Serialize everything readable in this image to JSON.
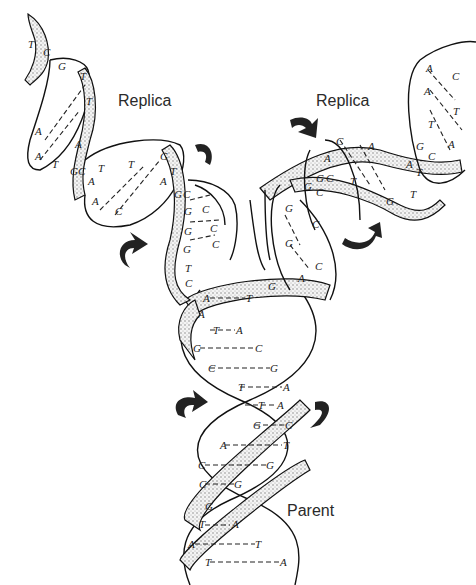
{
  "figure": {
    "labels": {
      "replica_left": "Replica",
      "replica_right": "Replica",
      "parent": "Parent"
    },
    "parent_pairs": [
      [
        "A",
        "T"
      ],
      [
        "A",
        ""
      ],
      [
        "T",
        "A"
      ],
      [
        "G",
        "C"
      ],
      [
        "C",
        "G"
      ],
      [
        "T",
        "A"
      ],
      [
        "T",
        "A"
      ],
      [
        "G",
        "C"
      ],
      [
        "A",
        "T"
      ],
      [
        "C",
        "G"
      ],
      [
        "C",
        "G"
      ],
      [
        "G",
        ""
      ],
      [
        "T",
        "A"
      ],
      [
        "A",
        "T"
      ],
      [
        "T",
        "A"
      ]
    ],
    "left_replica_bases": [
      "T",
      "C",
      "G",
      "T",
      "T",
      "A",
      "A",
      "T",
      "A",
      "G",
      "C",
      "A",
      "T",
      "T",
      "C",
      "A",
      "G",
      "C",
      "C",
      "G",
      "C",
      "G",
      "C",
      "G",
      "C",
      "T",
      "C"
    ],
    "right_replica_bases": [
      "A",
      "C",
      "A",
      "T",
      "T",
      "A",
      "C",
      "G",
      "A",
      "C",
      "A",
      "T",
      "G",
      "C",
      "C",
      "G",
      "T",
      "T",
      "G",
      "C",
      "C",
      "G",
      "G",
      "C",
      "G",
      "C",
      "A",
      "G"
    ],
    "fork_bases": [
      "G",
      "C",
      "G",
      "C",
      "G",
      "C",
      "T",
      "C",
      "G",
      "C",
      "G",
      "C",
      "G",
      "A"
    ],
    "arrows": [
      "rotation-arrow-left-replica",
      "rotation-arrow-right-replica",
      "rotation-arrow-parent-left",
      "rotation-arrow-parent-right"
    ]
  }
}
